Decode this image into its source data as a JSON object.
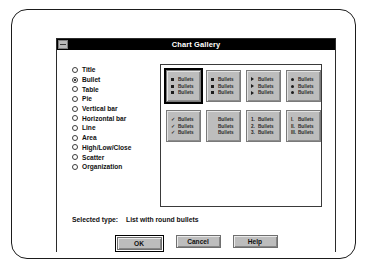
{
  "window": {
    "title": "Chart Gallery",
    "sysmenu_icon": "control-menu-box"
  },
  "type_list": {
    "label": "Chart type",
    "items": [
      {
        "label": "Title",
        "selected": false
      },
      {
        "label": "Bullet",
        "selected": true
      },
      {
        "label": "Table",
        "selected": false
      },
      {
        "label": "Pie",
        "selected": false
      },
      {
        "label": "Vertical bar",
        "selected": false
      },
      {
        "label": "Horizontal bar",
        "selected": false
      },
      {
        "label": "Line",
        "selected": false
      },
      {
        "label": "Area",
        "selected": false
      },
      {
        "label": "High/Low/Close",
        "selected": false
      },
      {
        "label": "Scatter",
        "selected": false
      },
      {
        "label": "Organization",
        "selected": false
      }
    ]
  },
  "gallery": {
    "thumbnails": [
      {
        "name": "square-bullets",
        "selected": true,
        "marker_kind": "square",
        "lines": [
          {
            "marker": "",
            "text": "Bullets"
          },
          {
            "marker": "",
            "text": "Bullets"
          },
          {
            "marker": "",
            "text": "Bullets"
          }
        ]
      },
      {
        "name": "small-square-bullets",
        "selected": false,
        "marker_kind": "square",
        "lines": [
          {
            "marker": "",
            "text": "Bullets"
          },
          {
            "marker": "",
            "text": "Bullets"
          },
          {
            "marker": "",
            "text": "Bullets"
          }
        ]
      },
      {
        "name": "triangle-bullets",
        "selected": false,
        "marker_kind": "triangle",
        "lines": [
          {
            "marker": "",
            "text": "Bullets"
          },
          {
            "marker": "",
            "text": "Bullets"
          },
          {
            "marker": "",
            "text": "Bullets"
          }
        ]
      },
      {
        "name": "round-bullets",
        "selected": false,
        "marker_kind": "circle",
        "lines": [
          {
            "marker": "",
            "text": "Bullets"
          },
          {
            "marker": "",
            "text": "Bullets"
          },
          {
            "marker": "",
            "text": "Bullets"
          }
        ]
      },
      {
        "name": "check-bullets",
        "selected": false,
        "marker_kind": "text",
        "lines": [
          {
            "marker": "✓",
            "text": "Bullets"
          },
          {
            "marker": "✓",
            "text": "Bullets"
          },
          {
            "marker": "✓",
            "text": "Bullets"
          }
        ]
      },
      {
        "name": "no-bullets",
        "selected": false,
        "marker_kind": "none",
        "lines": [
          {
            "marker": "",
            "text": "Bullets"
          },
          {
            "marker": "",
            "text": "Bullets"
          },
          {
            "marker": "",
            "text": "Bullets"
          }
        ]
      },
      {
        "name": "numbered-bullets",
        "selected": false,
        "marker_kind": "text",
        "lines": [
          {
            "marker": "1.",
            "text": "Bullets"
          },
          {
            "marker": "2.",
            "text": "Bullets"
          },
          {
            "marker": "3.",
            "text": "Bullets"
          }
        ]
      },
      {
        "name": "roman-numbered-bullets",
        "selected": false,
        "marker_kind": "text",
        "lines": [
          {
            "marker": "I.",
            "text": "Bullets"
          },
          {
            "marker": "II.",
            "text": "Bullets"
          },
          {
            "marker": "III.",
            "text": "Bullets"
          }
        ]
      }
    ]
  },
  "status": {
    "label": "Selected type:",
    "value": "List with round bullets"
  },
  "buttons": {
    "ok": "OK",
    "cancel": "Cancel",
    "help": "Help"
  },
  "colors": {
    "titlebar_bg": "#000000",
    "titlebar_fg": "#ffffff",
    "dialog_bg": "#ffffff",
    "control_face": "#bdbdbd",
    "selection_border": "#000000"
  }
}
